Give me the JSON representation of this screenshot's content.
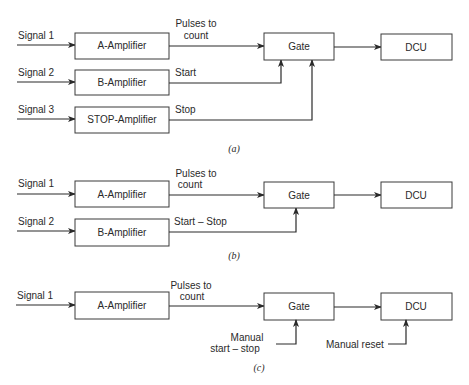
{
  "diagrams": {
    "a": {
      "caption": "(a)",
      "inputs": [
        "Signal 1",
        "Signal 2",
        "Signal 3"
      ],
      "blocks": {
        "amp1": "A-Amplifier",
        "amp2": "B-Amplifier",
        "amp3": "STOP-Amplifier",
        "gate": "Gate",
        "dcu": "DCU"
      },
      "wires": {
        "pulses_line1": "Pulses to",
        "pulses_line2": "count",
        "start": "Start",
        "stop": "Stop"
      }
    },
    "b": {
      "caption": "(b)",
      "inputs": [
        "Signal 1",
        "Signal 2"
      ],
      "blocks": {
        "amp1": "A-Amplifier",
        "amp2": "B-Amplifier",
        "gate": "Gate",
        "dcu": "DCU"
      },
      "wires": {
        "pulses_line1": "Pulses to",
        "pulses_line2": "count",
        "start_stop": "Start – Stop"
      }
    },
    "c": {
      "caption": "(c)",
      "inputs": [
        "Signal 1"
      ],
      "blocks": {
        "amp1": "A-Amplifier",
        "gate": "Gate",
        "dcu": "DCU"
      },
      "wires": {
        "pulses_line1": "Pulses to",
        "pulses_line2": "count",
        "manual_line1": "Manual",
        "manual_line2": "start – stop",
        "manual_reset": "Manual reset"
      }
    }
  }
}
